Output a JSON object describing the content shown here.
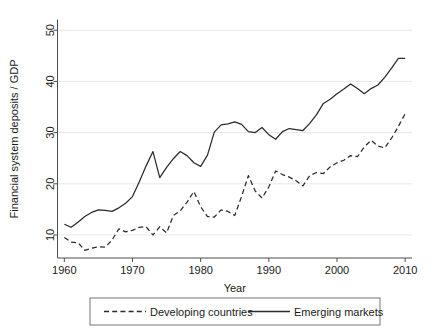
{
  "chart_data": {
    "type": "line",
    "title": "",
    "xlabel": "Year",
    "ylabel": "Financial system deposits / GDP",
    "xlim": [
      1959,
      2011
    ],
    "ylim": [
      5.5,
      52
    ],
    "grid": true,
    "legend_position": "bottom",
    "xticks": [
      1960,
      1970,
      1980,
      1990,
      2000,
      2010
    ],
    "yticks": [
      10,
      20,
      30,
      40,
      50
    ],
    "x": [
      1960,
      1961,
      1962,
      1963,
      1964,
      1965,
      1966,
      1967,
      1968,
      1969,
      1970,
      1971,
      1972,
      1973,
      1974,
      1975,
      1976,
      1977,
      1978,
      1979,
      1980,
      1981,
      1982,
      1983,
      1984,
      1985,
      1986,
      1987,
      1988,
      1989,
      1990,
      1991,
      1992,
      1993,
      1994,
      1995,
      1996,
      1997,
      1998,
      1999,
      2000,
      2001,
      2002,
      2003,
      2004,
      2005,
      2006,
      2007,
      2008,
      2009,
      2010
    ],
    "series": [
      {
        "name": "Developing countries",
        "style": "dashed",
        "color": "#2b2b2b",
        "values": [
          9.5,
          8.6,
          8.5,
          7.0,
          7.4,
          7.7,
          7.6,
          9.0,
          11.2,
          10.6,
          10.9,
          11.5,
          11.6,
          10.0,
          11.6,
          10.4,
          13.8,
          14.7,
          16.4,
          18.5,
          15.5,
          13.6,
          13.5,
          14.9,
          14.6,
          13.8,
          17.5,
          21.6,
          18.6,
          17.2,
          19.4,
          22.5,
          21.8,
          21.3,
          20.6,
          19.6,
          21.6,
          22.2,
          22.0,
          23.3,
          24.1,
          24.6,
          25.5,
          25.3,
          27.2,
          28.5,
          27.4,
          27.0,
          28.9,
          31.2,
          33.7
        ]
      },
      {
        "name": "Emerging markets",
        "style": "solid",
        "color": "#2b2b2b",
        "values": [
          12.1,
          11.5,
          12.5,
          13.6,
          14.4,
          14.9,
          14.8,
          14.6,
          15.3,
          16.2,
          17.5,
          20.4,
          23.5,
          26.3,
          21.2,
          23.2,
          24.9,
          26.3,
          25.5,
          24.1,
          23.4,
          25.6,
          30.1,
          31.5,
          31.7,
          32.1,
          31.6,
          30.2,
          30.0,
          31.0,
          29.6,
          28.7,
          30.2,
          30.8,
          30.6,
          30.4,
          31.8,
          33.5,
          35.7,
          36.5,
          37.6,
          38.5,
          39.5,
          38.6,
          37.6,
          38.6,
          39.3,
          40.8,
          42.6,
          44.5,
          44.5
        ]
      }
    ]
  },
  "legend": {
    "entries": [
      {
        "label": "Developing countries",
        "style": "dashed"
      },
      {
        "label": "Emerging markets",
        "style": "solid"
      }
    ]
  }
}
